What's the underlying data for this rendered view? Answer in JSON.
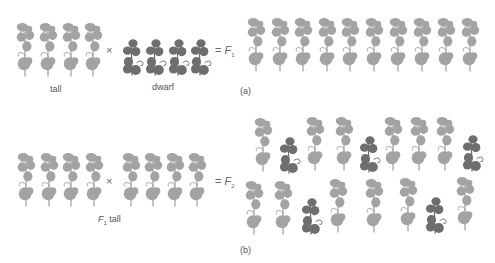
{
  "colors": {
    "tall": "#a3a3a3",
    "dwarf": "#6e6e6e",
    "text": "#555555"
  },
  "panel_a": {
    "caption": "(a)",
    "tall_label": "tall",
    "dwarf_label": "dwarf",
    "cross_symbol": "×",
    "equals_symbol": "=",
    "result_label": "F",
    "result_sub": "1",
    "tall_parent_count": 4,
    "dwarf_parent_count": 4,
    "f1_offspring": {
      "tall": 10,
      "dwarf": 0
    }
  },
  "panel_b": {
    "caption": "(b)",
    "parent_label": "F",
    "parent_sub": "1",
    "parent_label_suffix": " tall",
    "cross_symbol": "×",
    "equals_symbol": "=",
    "result_label": "F",
    "result_sub": "2",
    "parent_count_left": 4,
    "parent_count_right": 4,
    "f2_offspring": {
      "tall": 12,
      "dwarf": 5
    }
  }
}
